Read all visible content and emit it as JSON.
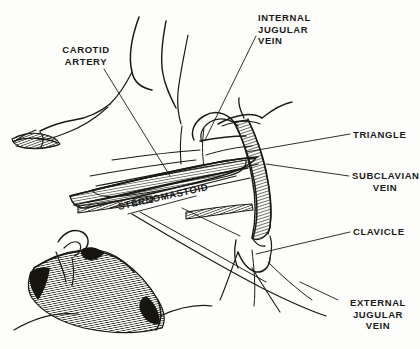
{
  "diagram": {
    "background_color": "#fdfdfb",
    "ink_color": "#1a1a18",
    "labels": [
      {
        "id": "carotid-artery",
        "text": "CAROTID\nARTERY",
        "lines": [
          "CAROTID",
          "ARTERY"
        ],
        "align": "center",
        "x": 38,
        "y": 44
      },
      {
        "id": "internal-jugular-vein",
        "text": "INTERNAL\nJUGULAR\nVEIN",
        "lines": [
          "INTERNAL",
          "JUGULAR",
          "VEIN"
        ],
        "align": "left",
        "x": 258,
        "y": 12
      },
      {
        "id": "triangle",
        "text": "TRIANGLE",
        "lines": [
          "TRIANGLE"
        ],
        "align": "left",
        "x": 353,
        "y": 129
      },
      {
        "id": "subclavian-vein",
        "text": "SUBCLAVIAN\nVEIN",
        "lines": [
          "SUBCLAVIAN",
          "VEIN"
        ],
        "align": "left",
        "x": 352,
        "y": 170
      },
      {
        "id": "clavicle",
        "text": "CLAVICLE",
        "lines": [
          "CLAVICLE"
        ],
        "align": "left",
        "x": 353,
        "y": 226
      },
      {
        "id": "external-jugular-vein",
        "text": "EXTERNAL\nJUGULAR\nVEIN",
        "lines": [
          "EXTERNAL",
          "JUGULAR",
          "VEIN"
        ],
        "align": "center",
        "x": 341,
        "y": 297
      },
      {
        "id": "sternomastoid",
        "text": "STERNOMASTOID",
        "lines": [
          "STERNOMASTOID"
        ],
        "align": "left",
        "x": 118,
        "y": 201,
        "rotation_deg": -12.5
      }
    ]
  },
  "label_text": {
    "carotid_artery_l1": "CAROTID",
    "carotid_artery_l2": "ARTERY",
    "internal_jugular_l1": "INTERNAL",
    "internal_jugular_l2": "JUGULAR",
    "internal_jugular_l3": "VEIN",
    "triangle": "TRIANGLE",
    "subclavian_l1": "SUBCLAVIAN",
    "subclavian_l2": "VEIN",
    "clavicle": "CLAVICLE",
    "external_jugular_l1": "EXTERNAL",
    "external_jugular_l2": "JUGULAR",
    "external_jugular_l3": "VEIN",
    "sternomastoid": "STERNOMASTOID"
  }
}
